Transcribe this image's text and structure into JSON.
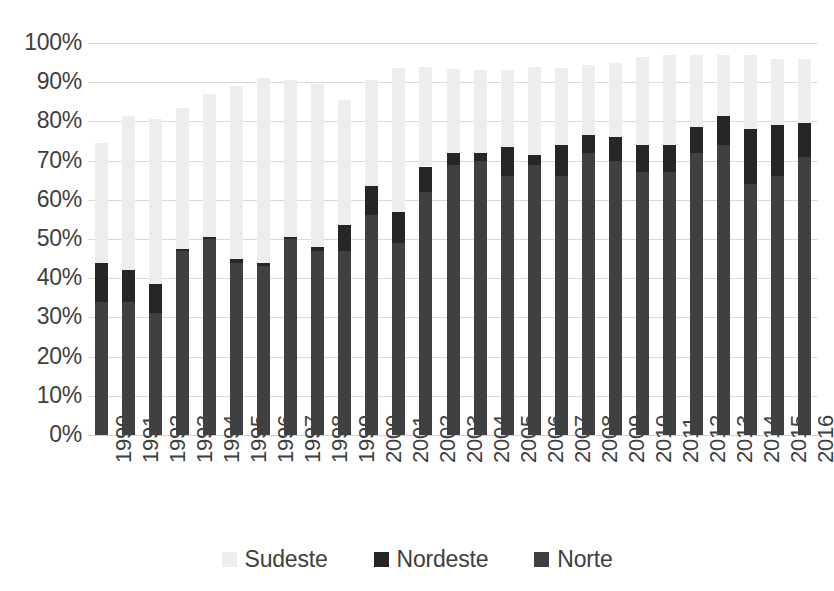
{
  "chart_data": {
    "type": "bar",
    "stacked": true,
    "stack_mode": "absolute-percent",
    "title": "",
    "subtitle": "",
    "xlabel": "",
    "ylabel": "",
    "ylim": [
      0,
      100
    ],
    "y_tick_labels": [
      "0%",
      "10%",
      "20%",
      "30%",
      "40%",
      "50%",
      "60%",
      "70%",
      "80%",
      "90%",
      "100%"
    ],
    "y_ticks": [
      0,
      10,
      20,
      30,
      40,
      50,
      60,
      70,
      80,
      90,
      100
    ],
    "grid": true,
    "legend_position": "bottom",
    "categories": [
      "1990",
      "1991",
      "1992",
      "1993",
      "1994",
      "1995",
      "1996",
      "1997",
      "1998",
      "1999",
      "2000",
      "2001",
      "2002",
      "2003",
      "2004",
      "2005",
      "2006",
      "2007",
      "2008",
      "2009",
      "2010",
      "2011",
      "2012",
      "2013",
      "2014",
      "2015",
      "2016"
    ],
    "series": [
      {
        "name": "Norte",
        "color": "#404040",
        "values": [
          34,
          34,
          31,
          47,
          50,
          44,
          43,
          50,
          47,
          47,
          56,
          49,
          62,
          69,
          70,
          66,
          69,
          66,
          72,
          70,
          67,
          67,
          72,
          74,
          64,
          66,
          71
        ]
      },
      {
        "name": "Nordeste",
        "color": "#262626",
        "values": [
          10,
          8,
          7.5,
          0.5,
          0.5,
          1,
          1,
          0.5,
          1,
          6.5,
          7.5,
          8,
          6.5,
          3,
          2,
          7.5,
          2.5,
          8,
          4.5,
          6,
          7,
          7,
          6.5,
          7.5,
          14,
          13,
          8.5
        ]
      },
      {
        "name": "Sudeste",
        "color": "#ededed",
        "values": [
          30.5,
          39.5,
          42,
          36,
          36.5,
          44,
          47,
          40,
          41.5,
          32,
          27,
          36.5,
          25.5,
          21.5,
          21,
          19.5,
          22.5,
          19.5,
          18,
          19,
          22.5,
          23,
          18.5,
          15.5,
          19,
          17,
          16.5
        ]
      }
    ],
    "totals": [
      74.5,
      81.5,
      80.5,
      83.5,
      87,
      89,
      91,
      90.5,
      89.5,
      85.5,
      90.5,
      93.5,
      94,
      93.5,
      93,
      93,
      94,
      93.5,
      94.5,
      95,
      96.5,
      97,
      97,
      97,
      97,
      96,
      96
    ]
  },
  "legend": {
    "items": [
      {
        "label": "Sudeste",
        "color": "#ededed"
      },
      {
        "label": "Nordeste",
        "color": "#262626"
      },
      {
        "label": "Norte",
        "color": "#404040"
      }
    ]
  }
}
